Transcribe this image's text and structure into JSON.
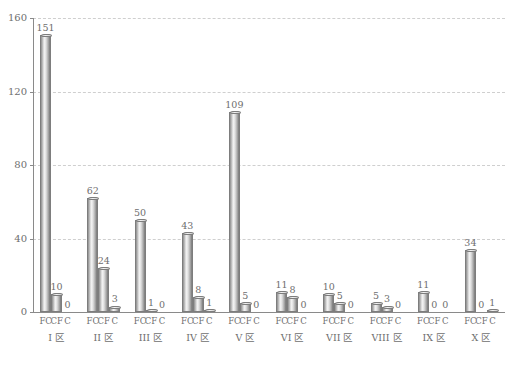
{
  "chart_data": {
    "type": "bar",
    "title": "",
    "subtitle": "",
    "xlabel": "",
    "ylabel": "",
    "ylim": [
      0,
      160
    ],
    "yticks": [
      0,
      40,
      80,
      120,
      160
    ],
    "ytick_labels": [
      "0",
      "40",
      "80",
      "120",
      "160"
    ],
    "grid": true,
    "grid_axis": "y",
    "legend": false,
    "legend_position": "none",
    "categories": [
      "I 区",
      "II 区",
      "III 区",
      "IV 区",
      "V 区",
      "VI 区",
      "VII 区",
      "VIII 区",
      "IX 区",
      "X 区"
    ],
    "series_labels": [
      "FC",
      "CF",
      "C"
    ],
    "series": [
      {
        "name": "FC",
        "values": [
          151,
          62,
          50,
          43,
          109,
          11,
          10,
          5,
          11,
          34
        ]
      },
      {
        "name": "CF",
        "values": [
          10,
          24,
          1,
          8,
          5,
          8,
          5,
          3,
          0,
          0
        ]
      },
      {
        "name": "C",
        "values": [
          0,
          3,
          0,
          1,
          0,
          0,
          0,
          0,
          0,
          1
        ]
      }
    ],
    "bar_value_labels": [
      [
        "151",
        "10",
        "0"
      ],
      [
        "62",
        "24",
        "3"
      ],
      [
        "50",
        "1",
        "0"
      ],
      [
        "43",
        "8",
        "1"
      ],
      [
        "109",
        "5",
        "0"
      ],
      [
        "11",
        "8",
        "0"
      ],
      [
        "10",
        "5",
        "0"
      ],
      [
        "5",
        "3",
        "0"
      ],
      [
        "11",
        "0",
        "0"
      ],
      [
        "34",
        "0",
        "1"
      ]
    ],
    "colors": {
      "bar_fill_light": "#f4f4f4",
      "bar_fill_mid": "#c9c9c9",
      "bar_edge": "#7d7d7d",
      "gridline": "#cfcfcf",
      "axis": "#8a8a8a",
      "text": "#6e6e6e",
      "background": "#ffffff"
    }
  }
}
